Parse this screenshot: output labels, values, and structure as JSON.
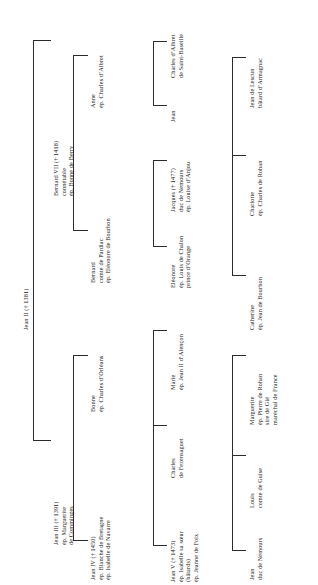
{
  "diagram": {
    "orientation": "text rotated 90 degrees counter-clockwise",
    "line_color": "#2b2b2b",
    "text_color": "#1a1a1a"
  },
  "nodes": {
    "jean2": {
      "lines": [
        "Jean II († 1381)"
      ]
    },
    "bernard7": {
      "lines": [
        "Bernard VII († 1418)",
        "connétable",
        "ép. Bonne de Berry"
      ]
    },
    "jean3": {
      "lines": [
        "Jean III († 1391)",
        "ép. Marguerite",
        "de Comminges"
      ]
    },
    "anne": {
      "lines": [
        "Anne",
        "ép. Charles d’Albret"
      ]
    },
    "bernard_pardiac": {
      "lines": [
        "Bernard",
        "comte de Pardiac",
        "ép. Eléonore de Bourbon"
      ]
    },
    "jean4": {
      "lines": [
        "Jean IV († 1450)",
        "ép. Blanche de Bretagne",
        "ép. Isabelle de Navarre"
      ]
    },
    "bonne": {
      "lines": [
        "Bonne",
        "ép. Charles d’Orléans"
      ]
    },
    "charles_albret_sb": {
      "lines": [
        "Charles d’Albret",
        "de Saint-Baseille"
      ]
    },
    "jean_albret": {
      "lines": [
        "Jean"
      ]
    },
    "eleonore": {
      "lines": [
        "Eléonore",
        "ép. Louis de Chalon",
        "prince d’Orange"
      ]
    },
    "jacques": {
      "lines": [
        "Jacques († 1477)",
        "duc de Nemours",
        "ép. Louise d’Anjou"
      ]
    },
    "jean5": {
      "lines": [
        "Jean V († 1473)",
        "ép. Isabelle sa sœur",
        "(bâtards)",
        "ép. Jeanne de Foix"
      ]
    },
    "charles_fez": {
      "lines": [
        "Charles",
        "de Fezensaguet"
      ]
    },
    "marie": {
      "lines": [
        "Marie",
        "ép. Jean II d’Alençon"
      ]
    },
    "charlotte": {
      "lines": [
        "Charlotte",
        "ép. Charles de Rohan"
      ]
    },
    "catherine": {
      "lines": [
        "Catherine",
        "ép. Jean de Bourbon"
      ]
    },
    "jean_lescun": {
      "lines": [
        "Jean de Lescun",
        "bâtard d’Armagnac"
      ]
    },
    "jean_nemours": {
      "lines": [
        "Jean",
        "duc de Nemours"
      ]
    },
    "louis_guise": {
      "lines": [
        "Louis",
        "comte de Guise"
      ]
    },
    "marguerite": {
      "lines": [
        "Marguerite",
        "ép. Pierre de Rohan",
        "sire de Gié",
        "maréchal de France"
      ]
    }
  }
}
